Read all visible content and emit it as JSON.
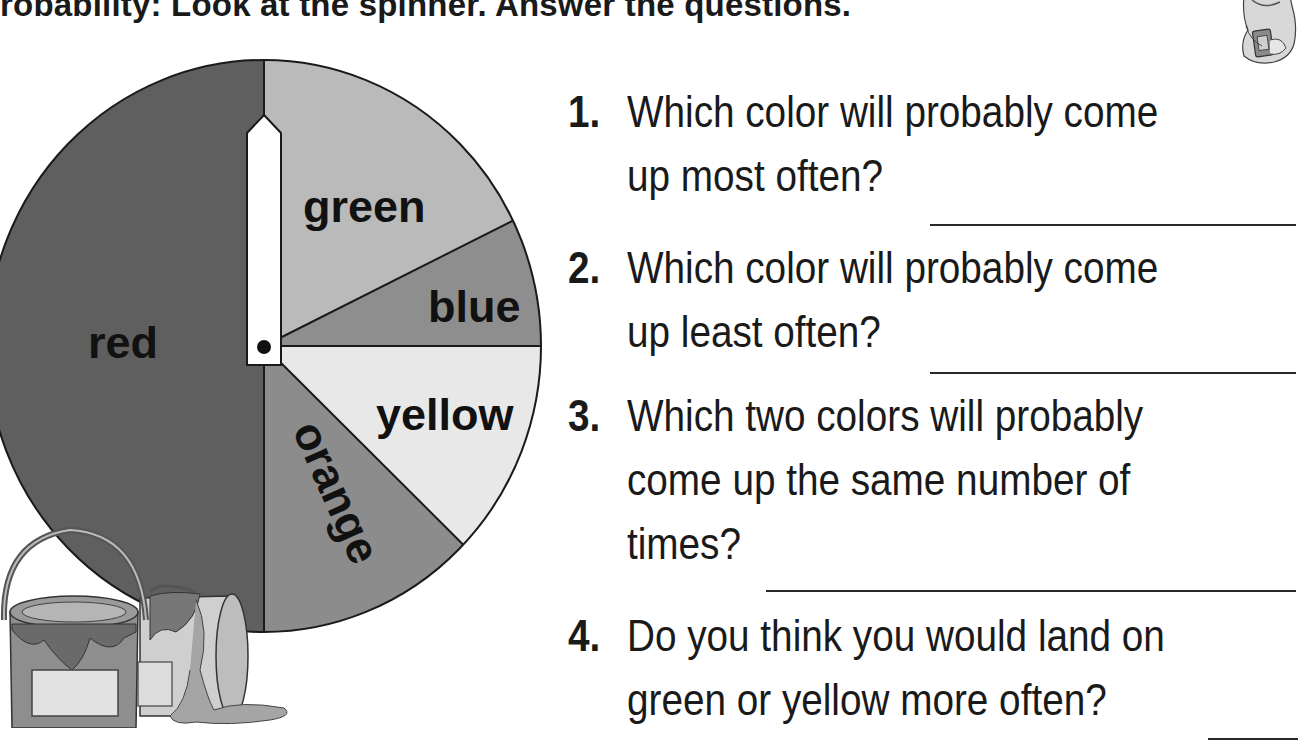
{
  "worksheet": {
    "title": "robability: Look at the spinner. Answer the questions.",
    "colors": {
      "red": "#5f5f5f",
      "green": "#bababa",
      "blue": "#8e8e8e",
      "yellow": "#e8e8e8",
      "orange": "#8c8c8c",
      "outline": "#1a1a1a",
      "pointer": "#ffffff"
    }
  },
  "spinner": {
    "sectors": [
      {
        "label": "green",
        "start_deg": 0,
        "end_deg": 64
      },
      {
        "label": "blue",
        "start_deg": 64,
        "end_deg": 90
      },
      {
        "label": "yellow",
        "start_deg": 90,
        "end_deg": 134
      },
      {
        "label": "orange",
        "start_deg": 134,
        "end_deg": 180
      },
      {
        "label": "red",
        "start_deg": 180,
        "end_deg": 360
      }
    ],
    "pointer_direction_deg": 0
  },
  "chart_data": {
    "type": "pie",
    "title": "Spinner",
    "categories": [
      "green",
      "blue",
      "yellow",
      "orange",
      "red"
    ],
    "values": [
      64,
      26,
      44,
      46,
      180
    ],
    "units": "degrees",
    "start_angle": "top, clockwise",
    "legend": "none (labels inside sectors)"
  },
  "questions": [
    {
      "number": "1.",
      "lines": [
        "Which color will probably come",
        "up most often?"
      ],
      "answer": ""
    },
    {
      "number": "2.",
      "lines": [
        "Which color will probably come",
        "up least often?"
      ],
      "answer": ""
    },
    {
      "number": "3.",
      "lines": [
        "Which two colors will probably",
        "come up the same number of",
        "times?"
      ],
      "answer": ""
    },
    {
      "number": "4.",
      "lines": [
        "Do you think you would land on",
        "green or yellow more often?"
      ],
      "answer": ""
    }
  ],
  "illustrations": {
    "top_right": "student-with-calculator-illustration",
    "bottom_left": "paint-cans-illustration"
  }
}
